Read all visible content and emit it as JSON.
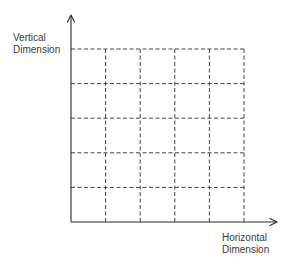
{
  "diagram": {
    "type": "grid-axes",
    "axes": {
      "vertical_label": [
        "Vertical",
        "Dimension"
      ],
      "horizontal_label": [
        "Horizontal",
        "Dimension"
      ]
    },
    "grid": {
      "columns": 5,
      "rows": 5,
      "line_style": "dashed"
    },
    "colors": {
      "line": "#2a2a2a",
      "grid": "#444444",
      "text": "#3a3a3a",
      "background": "#ffffff"
    }
  }
}
